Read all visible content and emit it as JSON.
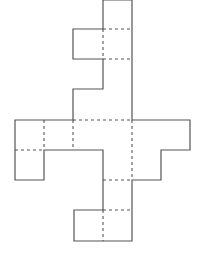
{
  "diagram": {
    "type": "cube-net-style polyomino figure",
    "stroke_color": "#555555",
    "background": "#ffffff",
    "outline_points": "103,0 132,0 132,120 190,120 190,150 161,150 161,180 132,180 132,241 74,241 74,210 103,210 103,150 44,150 44,180 15,180 15,120 73,120 73,89 103,89 103,59 73,59 73,29 103,29 103,0",
    "fold_lines": [
      {
        "x1": 103,
        "y1": 29,
        "x2": 132,
        "y2": 29
      },
      {
        "x1": 103,
        "y1": 29,
        "x2": 103,
        "y2": 59
      },
      {
        "x1": 103,
        "y1": 59,
        "x2": 132,
        "y2": 59
      },
      {
        "x1": 73,
        "y1": 120,
        "x2": 132,
        "y2": 120
      },
      {
        "x1": 44,
        "y1": 120,
        "x2": 44,
        "y2": 150
      },
      {
        "x1": 73,
        "y1": 120,
        "x2": 73,
        "y2": 150
      },
      {
        "x1": 15,
        "y1": 150,
        "x2": 44,
        "y2": 150
      },
      {
        "x1": 132,
        "y1": 120,
        "x2": 132,
        "y2": 180
      },
      {
        "x1": 103,
        "y1": 180,
        "x2": 132,
        "y2": 180
      },
      {
        "x1": 103,
        "y1": 210,
        "x2": 132,
        "y2": 210
      },
      {
        "x1": 103,
        "y1": 210,
        "x2": 103,
        "y2": 241
      }
    ]
  }
}
